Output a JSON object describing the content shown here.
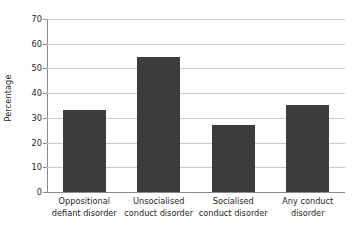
{
  "chart_data": {
    "type": "bar",
    "title": "",
    "xlabel": "",
    "ylabel": "Percentage",
    "categories": [
      "Oppositional defiant disorder",
      "Unsocialised conduct disorder",
      "Socialised conduct disorder",
      "Any conduct disorder"
    ],
    "category_lines": [
      [
        "Oppositional",
        "defiant disorder"
      ],
      [
        "Unsocialised",
        "conduct disorder"
      ],
      [
        "Socialised",
        "conduct disorder"
      ],
      [
        "Any conduct",
        "disorder"
      ]
    ],
    "values": [
      33.3,
      54.5,
      27.3,
      35.3
    ],
    "ylim": [
      0,
      70
    ],
    "yticks": [
      0,
      10,
      20,
      30,
      40,
      50,
      60,
      70
    ],
    "ytick_labels": [
      "0",
      "10",
      "20",
      "30",
      "40",
      "50",
      "60",
      "70"
    ],
    "grid": true,
    "legend": false,
    "legend_position": "none",
    "bar_color": "#3c3c3c",
    "gridline_color": "#c9c9c9",
    "axis_color": "#8b8b8b",
    "background_color": "#ffffff"
  }
}
